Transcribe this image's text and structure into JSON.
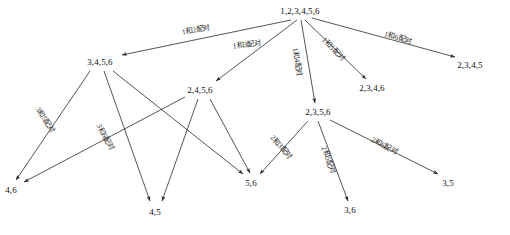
{
  "diagram": {
    "type": "directed-tree",
    "stroke_color": "#2b2b2b",
    "text_color": "#111111",
    "background": "#ffffff",
    "nodes": [
      {
        "id": "root",
        "label": "1,2,3,4,5,6",
        "x": 300,
        "y": 11
      },
      {
        "id": "n3456",
        "label": "3,4,5,6",
        "x": 100,
        "y": 62
      },
      {
        "id": "n2456",
        "label": "2,4,5,6",
        "x": 200,
        "y": 90
      },
      {
        "id": "n2356",
        "label": "2,3,5,6",
        "x": 318,
        "y": 112
      },
      {
        "id": "n2346",
        "label": "2,3,4,6",
        "x": 372,
        "y": 88
      },
      {
        "id": "n2345",
        "label": "2,3,4,5",
        "x": 470,
        "y": 65
      },
      {
        "id": "n46",
        "label": "4,6",
        "x": 11,
        "y": 190
      },
      {
        "id": "n45",
        "label": "4,5",
        "x": 155,
        "y": 212
      },
      {
        "id": "n56",
        "label": "5,6",
        "x": 251,
        "y": 183
      },
      {
        "id": "n36",
        "label": "3,6",
        "x": 350,
        "y": 210
      },
      {
        "id": "n35",
        "label": "3,5",
        "x": 448,
        "y": 183
      }
    ],
    "edges": [
      {
        "id": "e1",
        "from": "root",
        "to": "n3456",
        "x1": 291,
        "y1": 20,
        "x2": 122,
        "y2": 55,
        "label": "1和2配对",
        "lx": 196,
        "ly": 30,
        "angle": -11
      },
      {
        "id": "e2",
        "from": "root",
        "to": "n2456",
        "x1": 297,
        "y1": 20,
        "x2": 216,
        "y2": 81,
        "label": "1和3配对",
        "lx": 247,
        "ly": 45,
        "angle": -6
      },
      {
        "id": "e3",
        "from": "root",
        "to": "n2356",
        "x1": 301,
        "y1": 20,
        "x2": 315,
        "y2": 103,
        "label": "1和4配对",
        "lx": 297,
        "ly": 62,
        "angle": 80
      },
      {
        "id": "e4",
        "from": "root",
        "to": "n2346",
        "x1": 305,
        "y1": 20,
        "x2": 366,
        "y2": 79,
        "label": "1和5配对",
        "lx": 333,
        "ly": 49,
        "angle": 45
      },
      {
        "id": "e5",
        "from": "root",
        "to": "n2345",
        "x1": 312,
        "y1": 18,
        "x2": 455,
        "y2": 57,
        "label": "1和6配对",
        "lx": 398,
        "ly": 38,
        "angle": 15
      },
      {
        "id": "e6",
        "from": "n3456",
        "to": "n46",
        "x1": 90,
        "y1": 71,
        "x2": 16,
        "y2": 180,
        "label": "3和5配对",
        "lx": 45,
        "ly": 120,
        "angle": 56
      },
      {
        "id": "e7",
        "from": "n3456",
        "to": "n56",
        "x1": 113,
        "y1": 71,
        "x2": 243,
        "y2": 174,
        "label": "",
        "lx": 0,
        "ly": 0,
        "angle": 0
      },
      {
        "id": "e8",
        "from": "n3456",
        "to": "n45",
        "x1": 104,
        "y1": 71,
        "x2": 150,
        "y2": 201,
        "label": "",
        "lx": 0,
        "ly": 0,
        "angle": 0
      },
      {
        "id": "e9",
        "from": "n2456",
        "to": "n46",
        "x1": 185,
        "y1": 97,
        "x2": 24,
        "y2": 182,
        "label": "3和6配对",
        "lx": 105,
        "ly": 137,
        "angle": 62
      },
      {
        "id": "e10",
        "from": "n2456",
        "to": "n45",
        "x1": 198,
        "y1": 99,
        "x2": 162,
        "y2": 201,
        "label": "",
        "lx": 0,
        "ly": 0,
        "angle": 0
      },
      {
        "id": "e11",
        "from": "n2456",
        "to": "n56",
        "x1": 210,
        "y1": 99,
        "x2": 250,
        "y2": 173,
        "label": "",
        "lx": 0,
        "ly": 0,
        "angle": 0
      },
      {
        "id": "e12",
        "from": "n2356",
        "to": "n56",
        "x1": 308,
        "y1": 121,
        "x2": 260,
        "y2": 174,
        "label": "2和3配对",
        "lx": 281,
        "ly": 147,
        "angle": 48
      },
      {
        "id": "e13",
        "from": "n2356",
        "to": "n36",
        "x1": 318,
        "y1": 121,
        "x2": 348,
        "y2": 201,
        "label": "2和5配对",
        "lx": 328,
        "ly": 160,
        "angle": 70
      },
      {
        "id": "e14",
        "from": "n2356",
        "to": "n35",
        "x1": 330,
        "y1": 120,
        "x2": 438,
        "y2": 174,
        "label": "2和6配对",
        "lx": 384,
        "ly": 146,
        "angle": 27
      }
    ]
  }
}
